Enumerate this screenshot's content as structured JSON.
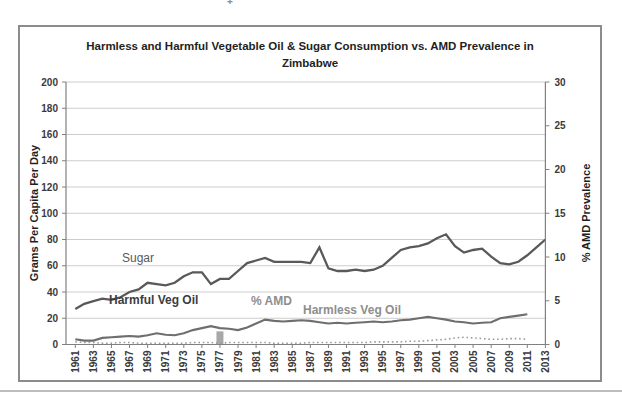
{
  "page": {
    "background": "#ffffff",
    "artifact_mark": "+"
  },
  "chart": {
    "title_lines": [
      "Harmless and Harmful Vegetable Oil & Sugar Consumption vs. AMD Prevalence in",
      "Zimbabwe"
    ],
    "left_axis_title": "Grams Per Capita Per Day",
    "right_axis_title": "% AMD Prevalence",
    "series_labels": {
      "sugar": "Sugar",
      "harmful": "Harmful Veg Oil",
      "amd": "% AMD",
      "harmless": "Harmless Veg Oil"
    }
  },
  "chart_data": {
    "type": "line",
    "title": "Harmless and Harmful Vegetable Oil & Sugar Consumption vs. AMD Prevalence in Zimbabwe",
    "grid": true,
    "legend_position": "none",
    "colors": {
      "sugar": "#595959",
      "harmful": "#6e6e6e",
      "harmless": "#9c9c9c",
      "amd_bar": "#a8a8a8",
      "gridline": "#cdcdcd",
      "axis": "#808080",
      "tick_text": "#3a3a3a"
    },
    "x": [
      1961,
      1962,
      1963,
      1964,
      1965,
      1966,
      1967,
      1968,
      1969,
      1970,
      1971,
      1972,
      1973,
      1974,
      1975,
      1976,
      1977,
      1978,
      1979,
      1980,
      1981,
      1982,
      1983,
      1984,
      1985,
      1986,
      1987,
      1988,
      1989,
      1990,
      1991,
      1992,
      1993,
      1994,
      1995,
      1996,
      1997,
      1998,
      1999,
      2000,
      2001,
      2002,
      2003,
      2004,
      2005,
      2006,
      2007,
      2008,
      2009,
      2010,
      2011,
      2012,
      2013
    ],
    "x_tick_labels": [
      1961,
      1963,
      1965,
      1967,
      1969,
      1971,
      1973,
      1975,
      1977,
      1979,
      1981,
      1983,
      1985,
      1987,
      1989,
      1991,
      1993,
      1995,
      1997,
      1999,
      2001,
      2003,
      2005,
      2007,
      2009,
      2011,
      2013
    ],
    "left_axis": {
      "label": "Grams Per Capita Per Day",
      "min": 0,
      "max": 200,
      "ticks": [
        0,
        20,
        40,
        60,
        80,
        100,
        120,
        140,
        160,
        180,
        200
      ]
    },
    "right_axis": {
      "label": "% AMD Prevalence",
      "min": 0,
      "max": 30,
      "ticks": [
        0,
        5,
        10,
        15,
        20,
        25,
        30
      ]
    },
    "series": [
      {
        "name": "Sugar",
        "type": "line",
        "axis": "left",
        "color": "#595959",
        "style": "solid",
        "values": [
          27,
          31,
          33,
          35,
          34,
          36,
          40,
          42,
          47,
          46,
          45,
          47,
          52,
          55,
          55,
          46,
          50,
          50,
          56,
          62,
          64,
          66,
          63,
          63,
          63,
          63,
          62,
          74,
          58,
          56,
          56,
          57,
          56,
          57,
          60,
          66,
          72,
          74,
          75,
          77,
          81,
          84,
          75,
          70,
          72,
          73,
          67,
          62,
          61,
          63,
          68,
          74,
          80
        ]
      },
      {
        "name": "Harmful Veg Oil",
        "type": "line",
        "axis": "left",
        "color": "#6e6e6e",
        "style": "solid",
        "values": [
          4,
          3,
          3,
          5,
          5.5,
          6,
          6.5,
          6,
          7,
          8.5,
          7.5,
          7,
          8.5,
          11,
          12.5,
          14,
          12.5,
          12,
          11,
          13,
          16,
          19,
          18,
          17.5,
          18,
          18.5,
          18,
          17,
          16,
          16.5,
          16,
          16.5,
          17,
          17.5,
          17,
          17.5,
          18.5,
          19,
          20,
          21,
          20,
          19,
          17.5,
          17,
          16,
          16.5,
          17,
          20,
          21,
          22,
          23,
          null,
          null
        ]
      },
      {
        "name": "Harmless Veg Oil",
        "type": "line",
        "axis": "left",
        "color": "#9c9c9c",
        "style": "dotted",
        "values": [
          2,
          1.5,
          1.5,
          1,
          1,
          1.5,
          1.5,
          1,
          1,
          1,
          1,
          1,
          1,
          1.5,
          1.5,
          1.5,
          1,
          1.5,
          1.5,
          1.5,
          1.5,
          1.5,
          1,
          1,
          1,
          1,
          1.5,
          1.5,
          1.5,
          1.5,
          1.5,
          1.5,
          1.5,
          2,
          2,
          2,
          2,
          2.5,
          2.5,
          3,
          3.5,
          4,
          5,
          5.5,
          5,
          4.5,
          4,
          4,
          4.5,
          4.5,
          4,
          null,
          null
        ]
      },
      {
        "name": "% AMD",
        "type": "bar",
        "axis": "right",
        "color": "#a8a8a8",
        "points": [
          {
            "x": 1977,
            "y": 1.5
          }
        ]
      }
    ]
  }
}
